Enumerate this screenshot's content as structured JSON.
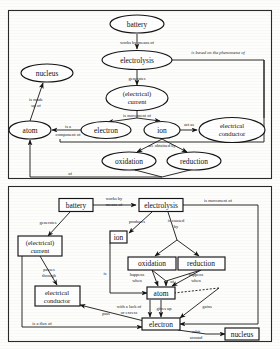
{
  "document": {
    "title": "Electrolysis concept maps",
    "page_background": "#fdfdfc",
    "ink_color": "#151515"
  },
  "diagrams": [
    {
      "id": "upper-concept-map",
      "node_shape": "ellipse",
      "nodes": [
        {
          "id": "battery",
          "label": "battery",
          "x": 137,
          "y": 24,
          "rx": 27,
          "ry": 9
        },
        {
          "id": "electrolysis",
          "label": "electrolysis",
          "x": 137,
          "y": 60,
          "rx": 35,
          "ry": 9.5
        },
        {
          "id": "nucleus",
          "label": "nucleus",
          "x": 47,
          "y": 73,
          "rx": 26,
          "ry": 9
        },
        {
          "id": "current",
          "label_line1": "(electrical)",
          "label_line2": "current",
          "x": 137,
          "y": 98,
          "rx": 31,
          "ry": 12
        },
        {
          "id": "atom",
          "label": "atom",
          "x": 30,
          "y": 130,
          "rx": 20,
          "ry": 9
        },
        {
          "id": "electron",
          "label": "electron",
          "x": 106,
          "y": 130,
          "rx": 25,
          "ry": 8.5
        },
        {
          "id": "ion",
          "label": "ion",
          "x": 162,
          "y": 130,
          "rx": 18,
          "ry": 8.5
        },
        {
          "id": "conductor",
          "label_line1": "electrical",
          "label_line2": "conductor",
          "x": 232,
          "y": 130,
          "rx": 33,
          "ry": 12
        },
        {
          "id": "oxidation",
          "label": "oxidation",
          "x": 129,
          "y": 161,
          "rx": 27,
          "ry": 9
        },
        {
          "id": "reduction",
          "label": "reduction",
          "x": 194,
          "y": 161,
          "rx": 27,
          "ry": 9
        }
      ],
      "edges": [
        {
          "from": "battery",
          "to": "electrolysis",
          "label": "works by means of"
        },
        {
          "from": "electrolysis",
          "to": "conductor",
          "label": "is based on the phenomena of"
        },
        {
          "from": "electrolysis",
          "to": "current",
          "label": "generates"
        },
        {
          "from": "current",
          "to": "electron",
          "label": "is movement of"
        },
        {
          "from": "current",
          "to": "ion",
          "label": ""
        },
        {
          "from": "atom",
          "to": "nucleus",
          "label_line1": "is made",
          "label_line2": "up of"
        },
        {
          "from": "electron",
          "to": "atom",
          "label_line1": "is a",
          "label_line2": "component of"
        },
        {
          "from": "ion",
          "to": "conductor",
          "label": "act as"
        },
        {
          "from": "ion",
          "to": "oxidation",
          "label": "are obtained by"
        },
        {
          "from": "ion",
          "to": "reduction",
          "label": ""
        },
        {
          "from": "oxidation",
          "to": "atom",
          "label": "of"
        },
        {
          "from": "reduction",
          "to": "atom",
          "label": ""
        }
      ]
    },
    {
      "id": "lower-concept-map",
      "node_shape": "rectangle",
      "nodes": [
        {
          "id": "battery",
          "label": "battery",
          "x": 76,
          "y": 205,
          "w": 34,
          "h": 13
        },
        {
          "id": "electrolysis",
          "label": "electrolysis",
          "x": 161,
          "y": 205,
          "w": 44,
          "h": 13
        },
        {
          "id": "ion",
          "label": "ion",
          "x": 118,
          "y": 237,
          "w": 16,
          "h": 12
        },
        {
          "id": "current",
          "label_line1": "(electrical)",
          "label_line2": "current",
          "x": 40,
          "y": 245,
          "w": 44,
          "h": 19
        },
        {
          "id": "oxidation",
          "label": "oxidation",
          "x": 152,
          "y": 263,
          "w": 33,
          "h": 12
        },
        {
          "id": "reduction",
          "label": "reduction",
          "x": 201,
          "y": 263,
          "w": 33,
          "h": 12
        },
        {
          "id": "conductor",
          "label_line1": "electrical",
          "label_line2": "conductor",
          "x": 57,
          "y": 296,
          "w": 43,
          "h": 19
        },
        {
          "id": "atom",
          "label": "atom",
          "x": 161,
          "y": 293,
          "w": 25,
          "h": 12
        },
        {
          "id": "electron",
          "label": "electron",
          "x": 161,
          "y": 324,
          "w": 33,
          "h": 12
        },
        {
          "id": "nucleus",
          "label": "nucleus",
          "x": 241,
          "y": 330,
          "w": 30,
          "h": 12
        }
      ],
      "edges": [
        {
          "from": "battery",
          "to": "electrolysis",
          "label_line1": "works by",
          "label_line2": "means of"
        },
        {
          "from": "battery",
          "to": "current",
          "label": "generates"
        },
        {
          "from": "electrolysis",
          "to": "ion",
          "label": "produces"
        },
        {
          "from": "electrolysis",
          "to": "oxidation",
          "label_line1": "is caused",
          "label_line2": "by"
        },
        {
          "from": "electrolysis",
          "to": "electron",
          "label": "is movement of"
        },
        {
          "from": "current",
          "to": "conductor",
          "label_line1": "passes",
          "label_line2": "through"
        },
        {
          "from": "current",
          "to": "electron",
          "label": "is a flux of"
        },
        {
          "from": "ion",
          "to": "atom",
          "label": "is"
        },
        {
          "from": "oxidation",
          "to": "atom",
          "label_line1": "happens",
          "label_line2": "when"
        },
        {
          "from": "reduction",
          "to": "atom",
          "label_line1": "happens",
          "label_line2": "when"
        },
        {
          "from": "oxidation",
          "to": "atom",
          "label": "of"
        },
        {
          "from": "atom",
          "to": "electron",
          "label_line1": "with a lack of",
          "label_line2": "or excess"
        },
        {
          "from": "atom",
          "to": "electron",
          "label": "gives up"
        },
        {
          "from": "atom",
          "to": "electron",
          "label": "gains"
        },
        {
          "from": "conductor",
          "to": "electron",
          "label": "pass"
        },
        {
          "from": "electron",
          "to": "nucleus",
          "label_line1": "orbit",
          "label_line2": "around"
        }
      ]
    }
  ]
}
